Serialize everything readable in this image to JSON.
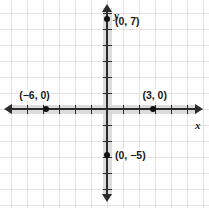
{
  "figure": {
    "type": "coordinate-plane",
    "width": 209,
    "height": 208,
    "background_color": "#ffffff"
  },
  "axes": {
    "x_label": "x",
    "y_label": "y",
    "axis_color": "#2b2b2b",
    "grid_color": "#e9dfe1",
    "origin_px": {
      "x": 107,
      "y": 109
    },
    "unit_px": 16,
    "x_range": [
      -6.7,
      6.4
    ],
    "y_range": [
      -6.2,
      6.2
    ],
    "grid": true,
    "arrows": [
      "left",
      "right",
      "up",
      "down"
    ]
  },
  "points": [
    {
      "id": "point-0-7",
      "label": "(0, 7)",
      "x": 0,
      "y": 5.6,
      "label_dx": 7,
      "label_dy": -4
    },
    {
      "id": "point-neg6-0",
      "label": "(−6, 0)",
      "x": -3.8,
      "y": 0,
      "label_dx": -28,
      "label_dy": -20
    },
    {
      "id": "point-3-0",
      "label": "(3, 0)",
      "x": 2.9,
      "y": 0,
      "label_dx": -12,
      "label_dy": -20
    },
    {
      "id": "point-0-neg5",
      "label": "(0, −5)",
      "x": 0,
      "y": -2.85,
      "label_dx": 7,
      "label_dy": -6
    }
  ],
  "chart_data": {
    "type": "scatter",
    "title": "",
    "xlabel": "x",
    "ylabel": "y",
    "xlim": [
      -6.7,
      6.4
    ],
    "ylim": [
      -6.2,
      6.2
    ],
    "grid": true,
    "legend": null,
    "series": [
      {
        "name": "plotted points",
        "points": [
          {
            "x": 0,
            "y": 7,
            "label": "(0, 7)"
          },
          {
            "x": -6,
            "y": 0,
            "label": "(−6, 0)"
          },
          {
            "x": 3,
            "y": 0,
            "label": "(3, 0)"
          },
          {
            "x": 0,
            "y": -5,
            "label": "(0, −5)"
          }
        ]
      }
    ],
    "annotations": [
      "(0, 7)",
      "(−6, 0)",
      "(3, 0)",
      "(0, −5)"
    ]
  }
}
